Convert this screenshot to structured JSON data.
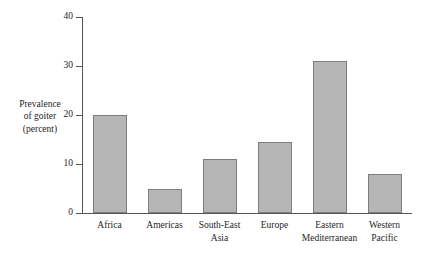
{
  "chart_data": {
    "type": "bar",
    "title": "",
    "xlabel": "",
    "ylabel": "Prevalence of goiter (percent)",
    "ylabel_lines": [
      "Prevalence",
      "of goiter",
      "(percent)"
    ],
    "categories": [
      "Africa",
      "Americas",
      "South-East Asia",
      "Europe",
      "Eastern Mediterranean",
      "Western Pacific"
    ],
    "category_lines": [
      [
        "Africa"
      ],
      [
        "Americas"
      ],
      [
        "South-East",
        "Asia"
      ],
      [
        "Europe"
      ],
      [
        "Eastern",
        "Mediterranean"
      ],
      [
        "Western",
        "Pacific"
      ]
    ],
    "values": [
      20,
      5,
      11,
      14.5,
      31,
      8
    ],
    "ylim": [
      0,
      40
    ],
    "yticks": [
      0,
      10,
      20,
      30,
      40
    ],
    "ytick_labels": [
      "0",
      "10",
      "20",
      "30",
      "40"
    ],
    "grid": false,
    "legend": false,
    "bar_fill": "#b6b6b6",
    "bar_border": "#7d7d7d",
    "axis_color": "#555555"
  }
}
